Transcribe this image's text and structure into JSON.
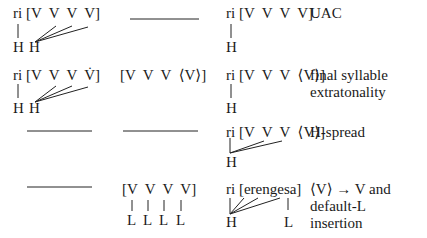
{
  "rows": [
    {
      "step": "UAC",
      "col1": {
        "seq": "ri [V  V  V  V]",
        "tones": [
          "H",
          "H"
        ]
      },
      "col2": {
        "empty": true
      },
      "col3": {
        "seq": "ri [V  V  V  V]",
        "tones": [
          "H"
        ]
      }
    },
    {
      "step": "final syllable\nextratonality",
      "col1": {
        "seq": "ri [V  V  V  V̇]",
        "tones": [
          "H",
          "H"
        ]
      },
      "col2": {
        "seq": "[V  V  V  ⟨V⟩]"
      },
      "col3": {
        "seq": "ri [V  V  V  ⟨V⟩]",
        "tones": [
          "H"
        ]
      }
    },
    {
      "step": "H-spread",
      "col1": {
        "empty": true
      },
      "col2": {
        "empty": true
      },
      "col3": {
        "seq": "ri [V  V  V  ⟨V⟩]",
        "tones": [
          "H"
        ]
      }
    },
    {
      "step": "⟨V⟩ → V and\ndefault-L\ninsertion",
      "col1": {
        "empty": true
      },
      "col2": {
        "seq": "[V  V  V  V]",
        "tones": [
          "L",
          "L",
          "L",
          "L"
        ]
      },
      "col3": {
        "seq": "ri [erengesa]",
        "tones": [
          "H",
          "L"
        ]
      }
    }
  ]
}
